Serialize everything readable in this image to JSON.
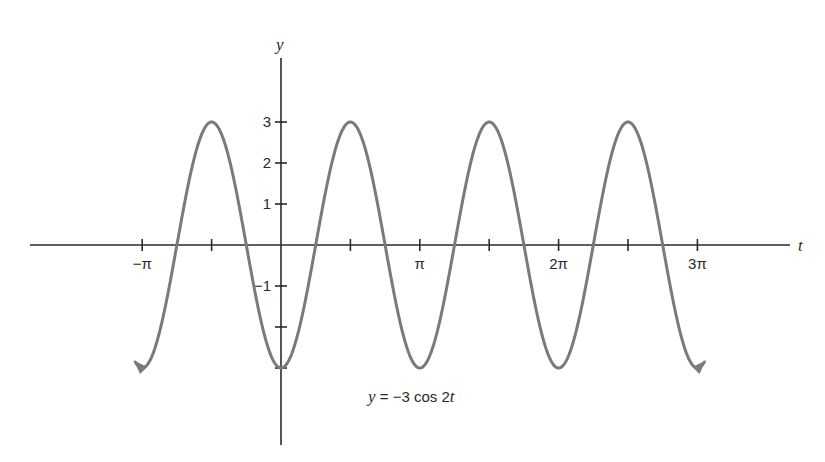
{
  "chart_data": {
    "type": "line",
    "title": "",
    "formula": {
      "var": "y",
      "eq": " = −3 cos 2",
      "t": "t"
    },
    "xlabel": "t",
    "ylabel": "y",
    "xlim_pi": [
      -1.05,
      3.05
    ],
    "ylim": [
      -3,
      3
    ],
    "grid": false,
    "legend": null,
    "x_ticks": [
      {
        "value_pi": -1,
        "label": "−π"
      },
      {
        "value_pi": -0.5,
        "label": ""
      },
      {
        "value_pi": 0.5,
        "label": ""
      },
      {
        "value_pi": 1,
        "label": "π"
      },
      {
        "value_pi": 1.5,
        "label": ""
      },
      {
        "value_pi": 2,
        "label": "2π"
      },
      {
        "value_pi": 2.5,
        "label": ""
      },
      {
        "value_pi": 3,
        "label": "3π"
      }
    ],
    "y_ticks": [
      {
        "value": 3,
        "label": "3"
      },
      {
        "value": 2,
        "label": "2"
      },
      {
        "value": 1,
        "label": "1"
      },
      {
        "value": -1,
        "label": "−1"
      },
      {
        "value": -2,
        "label": ""
      },
      {
        "value": -3,
        "label": ""
      }
    ],
    "series": [
      {
        "name": "y = −3 cos 2t",
        "function": "-3*cos(2*t)",
        "amplitude": 3,
        "period": "π",
        "color": "#7a7a7a",
        "x_pi": [
          -1,
          -0.75,
          -0.5,
          -0.25,
          0,
          0.25,
          0.5,
          0.75,
          1,
          1.25,
          1.5,
          1.75,
          2,
          2.25,
          2.5,
          2.75,
          3
        ],
        "values": [
          -3,
          0,
          3,
          0,
          -3,
          0,
          3,
          0,
          -3,
          0,
          3,
          0,
          -3,
          0,
          3,
          0,
          -3
        ],
        "arrow_ends": true
      }
    ]
  }
}
